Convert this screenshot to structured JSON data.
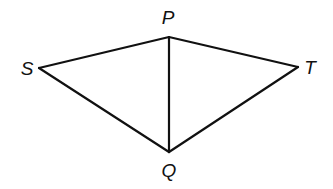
{
  "diagram": {
    "type": "geometry-figure",
    "vertices": {
      "P": {
        "label": "P",
        "x": 169,
        "y": 37,
        "label_x": 168,
        "label_y": 24
      },
      "S": {
        "label": "S",
        "x": 39,
        "y": 68,
        "label_x": 27,
        "label_y": 75
      },
      "T": {
        "label": "T",
        "x": 298,
        "y": 67,
        "label_x": 310,
        "label_y": 74
      },
      "Q": {
        "label": "Q",
        "x": 169,
        "y": 152,
        "label_x": 169,
        "label_y": 177
      }
    },
    "edges": [
      {
        "from": "S",
        "to": "P"
      },
      {
        "from": "P",
        "to": "T"
      },
      {
        "from": "T",
        "to": "Q"
      },
      {
        "from": "Q",
        "to": "S"
      },
      {
        "from": "P",
        "to": "Q"
      }
    ],
    "colors": {
      "line": "#111111",
      "background": "#ffffff"
    }
  }
}
